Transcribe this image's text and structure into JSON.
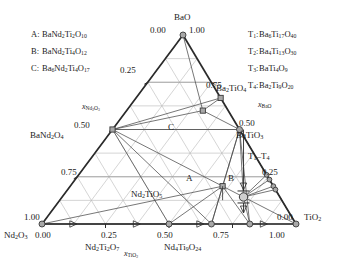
{
  "figure": {
    "type": "ternary-phase-diagram",
    "system": "BaO - Nd2O3 - TiO2",
    "background_color": "#ffffff",
    "line_color": "#2b2b2b",
    "grid_color": "#b9b9b9",
    "marker_fill": "#a8a8a8",
    "marker_stroke": "#3a3a3a"
  },
  "corners": {
    "top": {
      "label": "BaO",
      "left_value": "0.00",
      "right_value": "1.00"
    },
    "bottom_left": {
      "label": "Nd2O3",
      "left_value": "1.00",
      "bottom_value": "0.00"
    },
    "bottom_right": {
      "label": "TiO2",
      "bottom_value": "1.00",
      "right_value": "0.00"
    }
  },
  "axes": {
    "left": {
      "title": "xNd2O3",
      "title_base": "x",
      "title_sub": "Nd2O3",
      "ticks": [
        "0.25",
        "0.50",
        "0.75"
      ]
    },
    "right": {
      "title": "xBaO",
      "title_base": "x",
      "title_sub": "BaO",
      "ticks": [
        "0.75",
        "0.50",
        "0.25"
      ]
    },
    "bottom": {
      "title": "xTiO2",
      "title_base": "x",
      "title_sub": "TiO2",
      "ticks": [
        "0.25",
        "0.50",
        "0.75"
      ]
    }
  },
  "legend_left": {
    "title": "",
    "items": [
      {
        "key": "A:",
        "formula": "BaNd2Ti2O10"
      },
      {
        "key": "B:",
        "formula": "BaNd2Ti4O12"
      },
      {
        "key": "C:",
        "formula": "Ba6Nd2Ti4O17"
      }
    ]
  },
  "legend_right": {
    "items": [
      {
        "key": "T1:",
        "formula": "Ba6Ti17O40"
      },
      {
        "key": "T2:",
        "formula": "Ba4Ti13O30"
      },
      {
        "key": "T3:",
        "formula": "BaTi4O9"
      },
      {
        "key": "T4:",
        "formula": "Ba2Ti9O20"
      }
    ]
  },
  "compound_labels": [
    {
      "name": "Ba2TiO4",
      "position": "right-upper-edge"
    },
    {
      "name": "BaTiO3",
      "position": "right-edge"
    },
    {
      "name": "BaNd2O4",
      "position": "left-edge"
    },
    {
      "name": "Nd2TiO5",
      "position": "interior-lower-left"
    },
    {
      "name": "Nd2Ti2O7",
      "position": "bottom-edge"
    },
    {
      "name": "Nd4Ti9O24",
      "position": "bottom-edge"
    },
    {
      "name": "T1-T4",
      "position": "right-edge-cluster"
    },
    {
      "name": "A",
      "position": "interior"
    },
    {
      "name": "B",
      "position": "interior"
    },
    {
      "name": "C",
      "position": "interior"
    }
  ],
  "chart_data": {
    "type": "scatter",
    "title": "",
    "xlabel": "xTiO2",
    "ylabel": "xNd2O3",
    "axis3label": "xBaO",
    "grid": true,
    "legend_position": "outside-top-left-and-top-right",
    "axis_ranges": {
      "BaO": [
        0,
        1
      ],
      "Nd2O3": [
        0,
        1
      ],
      "TiO2": [
        0,
        1
      ]
    },
    "tick_step": 0.25,
    "points": [
      {
        "name": "BaO",
        "BaO": 1.0,
        "Nd2O3": 0.0,
        "TiO2": 0.0
      },
      {
        "name": "Nd2O3",
        "BaO": 0.0,
        "Nd2O3": 1.0,
        "TiO2": 0.0
      },
      {
        "name": "TiO2",
        "BaO": 0.0,
        "Nd2O3": 0.0,
        "TiO2": 1.0
      },
      {
        "name": "Ba2TiO4",
        "BaO": 0.667,
        "Nd2O3": 0.0,
        "TiO2": 0.333
      },
      {
        "name": "BaTiO3",
        "BaO": 0.5,
        "Nd2O3": 0.0,
        "TiO2": 0.5
      },
      {
        "name": "T1",
        "BaO": 0.26,
        "Nd2O3": 0.0,
        "TiO2": 0.74
      },
      {
        "name": "T2",
        "BaO": 0.235,
        "Nd2O3": 0.0,
        "TiO2": 0.765
      },
      {
        "name": "T3",
        "BaO": 0.2,
        "Nd2O3": 0.0,
        "TiO2": 0.8
      },
      {
        "name": "T4",
        "BaO": 0.182,
        "Nd2O3": 0.0,
        "TiO2": 0.818
      },
      {
        "name": "BaNd2O4",
        "BaO": 0.5,
        "Nd2O3": 0.5,
        "TiO2": 0.0
      },
      {
        "name": "Nd2TiO5",
        "BaO": 0.0,
        "Nd2O3": 0.5,
        "TiO2": 0.5
      },
      {
        "name": "Nd2Ti2O7",
        "BaO": 0.0,
        "Nd2O3": 0.333,
        "TiO2": 0.667
      },
      {
        "name": "Nd4Ti9O24",
        "BaO": 0.0,
        "Nd2O3": 0.182,
        "TiO2": 0.818
      },
      {
        "name": "C",
        "BaO": 0.6,
        "Nd2O3": 0.1,
        "TiO2": 0.3
      },
      {
        "name": "A",
        "BaO": 0.2,
        "Nd2O3": 0.2,
        "TiO2": 0.6
      },
      {
        "name": "B",
        "BaO": 0.143,
        "Nd2O3": 0.143,
        "TiO2": 0.714
      }
    ]
  }
}
